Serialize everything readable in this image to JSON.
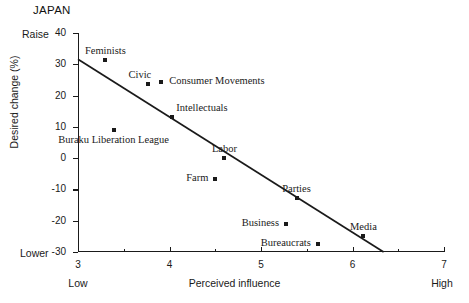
{
  "title": "JAPAN",
  "axis": {
    "y_title": "Desired change (%)",
    "x_title": "Perceived influence",
    "y_top_anchor": "Raise",
    "y_bottom_anchor": "Lower",
    "x_left_anchor": "Low",
    "x_right_anchor": "High"
  },
  "chart_data": {
    "type": "scatter",
    "title": "JAPAN",
    "xlabel": "Perceived influence",
    "ylabel": "Desired change (%)",
    "xlim": [
      3,
      7
    ],
    "ylim": [
      -30,
      40
    ],
    "xticks": [
      3,
      4,
      5,
      6,
      7
    ],
    "xticks_minor": [
      3.5,
      4.5,
      5.5,
      6.5
    ],
    "yticks": [
      40,
      30,
      20,
      10,
      0,
      -10,
      -20,
      -30
    ],
    "grid": false,
    "legend": "none",
    "annotations": {
      "y_top": "Raise",
      "y_bottom": "Lower",
      "x_left": "Low",
      "x_right": "High"
    },
    "points": [
      {
        "label": "Feminists",
        "x": 3.3,
        "y": 31.3,
        "label_pos": "above"
      },
      {
        "label": "Buraku Liberation League",
        "x": 3.39,
        "y": 9.1,
        "label_pos": "below"
      },
      {
        "label": "Civic",
        "x": 3.76,
        "y": 23.6,
        "label_pos": "above-left"
      },
      {
        "label": "Consumer Movements",
        "x": 3.91,
        "y": 24.3,
        "label_pos": "right"
      },
      {
        "label": "Intellectuals",
        "x": 4.03,
        "y": 13.1,
        "label_pos": "above-right"
      },
      {
        "label": "Farm",
        "x": 4.5,
        "y": -6.7,
        "label_pos": "left"
      },
      {
        "label": "Labor",
        "x": 4.6,
        "y": 0.0,
        "label_pos": "above"
      },
      {
        "label": "Business",
        "x": 5.27,
        "y": -21.2,
        "label_pos": "left"
      },
      {
        "label": "Parties",
        "x": 5.39,
        "y": -12.8,
        "label_pos": "above"
      },
      {
        "label": "Bureaucrats",
        "x": 5.62,
        "y": -27.6,
        "label_pos": "left"
      },
      {
        "label": "Media",
        "x": 6.12,
        "y": -24.9,
        "label_pos": "above"
      }
    ],
    "fit_line": {
      "x_start": 3.0,
      "y_start": 31.6,
      "x_end": 6.34,
      "y_end": -30.0
    }
  }
}
